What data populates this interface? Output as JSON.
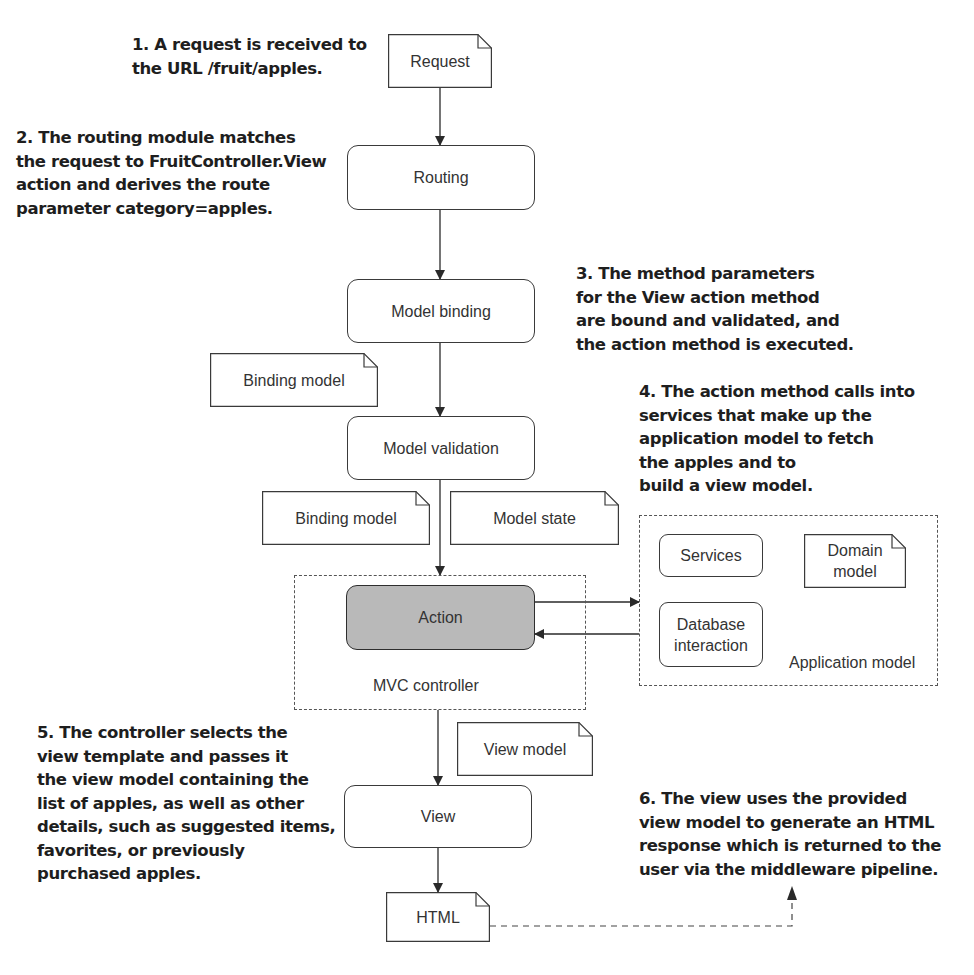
{
  "annotations": [
    {
      "id": "step1",
      "text": "1. A request is received to\nthe URL /fruit/apples."
    },
    {
      "id": "step2",
      "text": "2. The routing module matches\nthe request to FruitController.View\naction and derives the route\nparameter category=apples."
    },
    {
      "id": "step3",
      "text": "3. The method parameters\nfor the View action method\nare bound and validated, and\nthe action method is executed."
    },
    {
      "id": "step4",
      "text": "4. The action method calls into\nservices that make up the\napplication model to fetch\nthe apples and to\nbuild a view model."
    },
    {
      "id": "step5",
      "text": "5. The controller selects the\nview template and passes it\nthe view model containing the\nlist of apples, as well as other\ndetails, such as suggested items,\nfavorites, or previously\npurchased apples."
    },
    {
      "id": "step6",
      "text": "6. The view uses the provided\nview model to generate an HTML\nresponse which is returned to the\nuser via the middleware pipeline."
    }
  ],
  "documents": {
    "request": "Request",
    "binding_model_1": "Binding model",
    "binding_model_2": "Binding model",
    "model_state": "Model state",
    "domain_model": "Domain\nmodel",
    "view_model": "View model",
    "html": "HTML"
  },
  "processes": {
    "routing": "Routing",
    "model_binding": "Model binding",
    "model_validation": "Model validation",
    "action": "Action",
    "services": "Services",
    "database_interaction": "Database\ninteraction",
    "view": "View"
  },
  "groups": {
    "mvc_controller": "MVC controller",
    "application_model": "Application model"
  },
  "colors": {
    "action_fill": "#b9b9b9",
    "stroke": "#3a3a3a",
    "text": "#1e1e1e"
  }
}
